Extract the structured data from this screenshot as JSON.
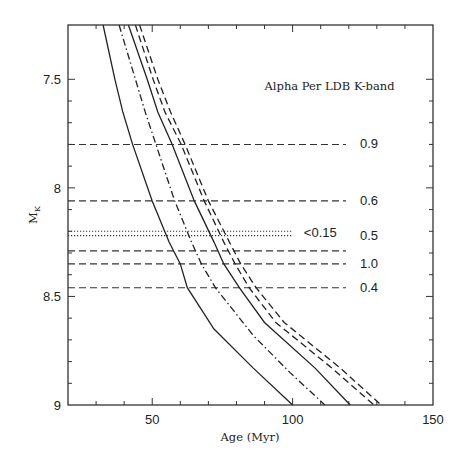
{
  "chart_data": {
    "type": "line",
    "title": "Alpha Per LDB K-band",
    "xlabel": "Age (Myr)",
    "ylabel": "M_K",
    "xlim": [
      20,
      150
    ],
    "ylim": [
      9,
      7.25
    ],
    "y_inverted": true,
    "x_major_ticks": [
      50,
      100,
      150
    ],
    "x_minor_step": 10,
    "y_major_ticks": [
      7.5,
      8,
      8.5,
      9
    ],
    "y_minor_step": 0.1,
    "grid": false,
    "series": [
      {
        "name": "model-solid-1",
        "style": "solid",
        "points": [
          [
            32.5,
            7.25
          ],
          [
            36.7,
            7.5
          ],
          [
            39.5,
            7.65
          ],
          [
            43,
            7.8
          ],
          [
            50,
            8.06
          ],
          [
            56,
            8.25
          ],
          [
            60,
            8.35
          ],
          [
            62.5,
            8.46
          ],
          [
            72,
            8.65
          ],
          [
            86,
            8.83
          ],
          [
            100,
            9.0
          ]
        ]
      },
      {
        "name": "model-dashdot",
        "style": "dashdot",
        "points": [
          [
            38.2,
            7.25
          ],
          [
            44,
            7.5
          ],
          [
            47.5,
            7.65
          ],
          [
            51.3,
            7.8
          ],
          [
            58,
            8.06
          ],
          [
            64,
            8.25
          ],
          [
            67.5,
            8.35
          ],
          [
            72.5,
            8.46
          ],
          [
            86,
            8.68
          ],
          [
            99,
            8.85
          ],
          [
            111.5,
            9.0
          ]
        ]
      },
      {
        "name": "model-solid-2",
        "style": "solid",
        "points": [
          [
            41.5,
            7.25
          ],
          [
            48.2,
            7.5
          ],
          [
            52,
            7.65
          ],
          [
            57.1,
            7.8
          ],
          [
            65,
            8.06
          ],
          [
            72,
            8.25
          ],
          [
            75.5,
            8.35
          ],
          [
            81,
            8.46
          ],
          [
            90,
            8.62
          ],
          [
            108,
            8.83
          ],
          [
            120.5,
            9.0
          ]
        ]
      },
      {
        "name": "model-dashed-1",
        "style": "dashed",
        "points": [
          [
            44,
            7.25
          ],
          [
            50.3,
            7.5
          ],
          [
            54.5,
            7.65
          ],
          [
            60.3,
            7.8
          ],
          [
            68.5,
            8.06
          ],
          [
            75.5,
            8.25
          ],
          [
            79.5,
            8.35
          ],
          [
            84.5,
            8.46
          ],
          [
            94,
            8.62
          ],
          [
            114,
            8.83
          ],
          [
            129,
            9.0
          ]
        ]
      },
      {
        "name": "model-dashed-2",
        "style": "dashed",
        "points": [
          [
            45.5,
            7.25
          ],
          [
            52,
            7.5
          ],
          [
            56.5,
            7.65
          ],
          [
            61.7,
            7.8
          ],
          [
            70,
            8.06
          ],
          [
            77.5,
            8.25
          ],
          [
            81.5,
            8.35
          ],
          [
            87,
            8.46
          ],
          [
            97,
            8.62
          ],
          [
            117,
            8.83
          ],
          [
            131.5,
            9.0
          ]
        ]
      }
    ],
    "horizontal_lines": [
      {
        "label": "0.9",
        "y": 7.8,
        "style": "dashed",
        "x_end": 119,
        "label_x": 124,
        "label_y": 7.8
      },
      {
        "label": "0.6",
        "y": 8.06,
        "style": "dashed",
        "x_end": 119,
        "label_x": 124,
        "label_y": 8.06
      },
      {
        "label": "<0.15",
        "y": 8.2,
        "style": "dotted",
        "x_end": 100,
        "label_x": 104,
        "label_y": 8.21
      },
      {
        "label": "",
        "y": 8.22,
        "style": "dotted",
        "x_end": 100
      },
      {
        "label": "0.5",
        "y": 8.29,
        "style": "dashed",
        "x_end": 119,
        "label_x": 124,
        "label_y": 8.22
      },
      {
        "label": "1.0",
        "y": 8.35,
        "style": "dashed",
        "x_end": 119,
        "label_x": 124,
        "label_y": 8.35
      },
      {
        "label": "0.4",
        "y": 8.46,
        "style": "dashed",
        "x_end": 119,
        "label_x": 124,
        "label_y": 8.46
      }
    ],
    "annotation": {
      "text": "Alpha Per LDB K-band",
      "x": 90,
      "y": 7.53
    }
  },
  "labels": {
    "title": "Alpha Per LDB K-band",
    "xlabel": "Age (Myr)",
    "ylabel_main": "M",
    "ylabel_sub": "K"
  }
}
